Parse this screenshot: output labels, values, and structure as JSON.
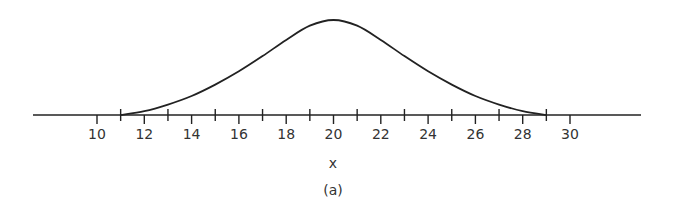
{
  "chart_data": {
    "type": "line",
    "title": "",
    "caption": "(a)",
    "xlabel": "x",
    "ylabel": "",
    "xlim": [
      7.3,
      32.8
    ],
    "x_ticks_major": [
      10,
      12,
      14,
      16,
      18,
      20,
      22,
      24,
      26,
      28,
      30
    ],
    "x_ticks_minor": [
      11,
      13,
      15,
      17,
      19,
      21,
      23,
      25,
      27,
      29
    ],
    "tick_labels": [
      "10",
      "12",
      "14",
      "16",
      "18",
      "20",
      "22",
      "24",
      "26",
      "28",
      "30"
    ],
    "grid": false,
    "legend": null,
    "series": [
      {
        "name": "bell curve",
        "description": "Symmetric bell-shaped curve centered at x=20, touching axis near x=11 and x=29",
        "x": [
          11,
          12,
          13,
          14,
          15,
          16,
          17,
          18,
          19,
          20,
          21,
          22,
          23,
          24,
          25,
          26,
          27,
          28,
          29
        ],
        "y": [
          0.0,
          0.04,
          0.11,
          0.2,
          0.32,
          0.46,
          0.62,
          0.79,
          0.94,
          1.0,
          0.94,
          0.79,
          0.62,
          0.46,
          0.32,
          0.2,
          0.11,
          0.04,
          0.0
        ]
      }
    ]
  }
}
